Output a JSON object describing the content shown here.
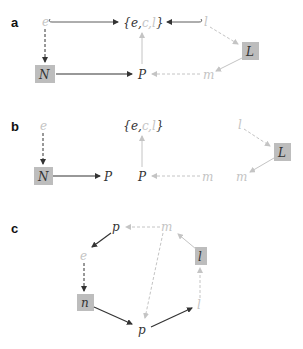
{
  "colors": {
    "dark": "#333333",
    "light": "#c4c4c4",
    "box": "#bdbdbd"
  },
  "panels": [
    {
      "label": "a",
      "nodes": {
        "e": "e",
        "set_open": "{",
        "set_e": "e",
        "set_c": "c",
        "set_l": "l",
        "set_close": "}",
        "comma": ",",
        "l": "l",
        "L": "L",
        "N": "N",
        "P": "P",
        "m": "m"
      }
    },
    {
      "label": "b",
      "nodes": {
        "e": "e",
        "N": "N",
        "P_left": "P",
        "set_open": "{",
        "set_e": "e",
        "set_c": "c",
        "set_l": "l",
        "set_close": "}",
        "comma": ",",
        "P_mid": "P",
        "m_mid": "m",
        "l": "l",
        "L": "L",
        "m_right": "m"
      }
    },
    {
      "label": "c",
      "nodes": {
        "p_top": "p",
        "m": "m",
        "e": "e",
        "l_box": "l",
        "n": "n",
        "p_bottom": "p",
        "l_bottom": "l"
      }
    }
  ]
}
